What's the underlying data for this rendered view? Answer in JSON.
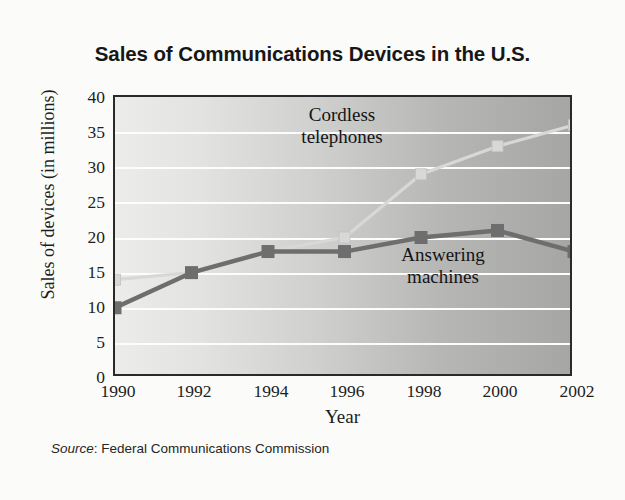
{
  "figure": {
    "title": "Sales of Communications Devices in the U.S.",
    "source_word": "Source",
    "source_text": ": Federal Communications Commission"
  },
  "axes": {
    "xlabel": "Year",
    "ylabel": "Sales of devices (in millions)",
    "yticks": [
      "40",
      "35",
      "30",
      "25",
      "20",
      "15",
      "10",
      "5",
      "0"
    ],
    "xticks": [
      "1990",
      "1992",
      "1994",
      "1996",
      "1998",
      "2000",
      "2002"
    ]
  },
  "annotations": {
    "cordless": "Cordless\ntelephones",
    "answering": "Answering\nmachines"
  },
  "colors": {
    "answering_machines": "#6e6e6e",
    "cordless_telephones": "#d8d8d6",
    "frame": "#2a2a2a",
    "gridline": "#fdfdfd",
    "plot_background_left": "#ececeb",
    "plot_background_right": "#a6a6a5",
    "page_background": "#fbfbf9",
    "title_text": "#171717"
  },
  "chart_data": {
    "type": "line",
    "title": "Sales of Communications Devices in the U.S.",
    "xlabel": "Year",
    "ylabel": "Sales of devices (in millions)",
    "x": [
      1990,
      1992,
      1994,
      1996,
      1998,
      2000,
      2002
    ],
    "xlim": [
      1990,
      2002
    ],
    "ylim": [
      0,
      40
    ],
    "ytick_step": 5,
    "grid": "horizontal",
    "legend": "inline-annotations",
    "units": "millions of devices",
    "series": [
      {
        "name": "Answering machines",
        "color": "#6e6e6e",
        "marker": "square",
        "values": [
          10,
          15,
          18,
          18,
          20,
          21,
          18
        ]
      },
      {
        "name": "Cordless telephones",
        "color": "#d8d8d6",
        "marker": "square",
        "values": [
          14,
          15,
          18,
          20,
          29,
          33,
          36
        ]
      }
    ],
    "source": "Source: Federal Communications Commission"
  }
}
